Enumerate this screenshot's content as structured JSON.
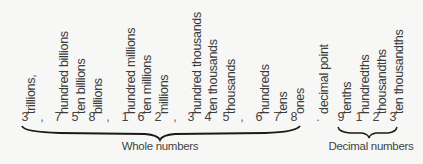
{
  "labels": [
    {
      "text": "trillions,",
      "x": 31
    },
    {
      "text": "hundred billions",
      "x": 64
    },
    {
      "text": "ten billions",
      "x": 81
    },
    {
      "text": "billions",
      "x": 98
    },
    {
      "text": "hundred millions",
      "x": 131
    },
    {
      "text": "ten millions",
      "x": 147
    },
    {
      "text": "millions",
      "x": 164
    },
    {
      "text": "hundred thousands",
      "x": 197
    },
    {
      "text": "ten thousands",
      "x": 213
    },
    {
      "text": "thousands",
      "x": 231
    },
    {
      "text": "hundreds",
      "x": 265
    },
    {
      "text": "tens",
      "x": 283
    },
    {
      "text": "ones",
      "x": 300
    },
    {
      "text": "decimal point",
      "x": 324
    },
    {
      "text": "tenths",
      "x": 347
    },
    {
      "text": "hundredths",
      "x": 365
    },
    {
      "text": "thousandths",
      "x": 382
    },
    {
      "text": "ten thousandths",
      "x": 399
    }
  ],
  "digits": [
    {
      "text": "3",
      "x": 25
    },
    {
      "text": ",",
      "x": 42,
      "sep": true
    },
    {
      "text": "7",
      "x": 58
    },
    {
      "text": "5",
      "x": 75
    },
    {
      "text": "8",
      "x": 92
    },
    {
      "text": ",",
      "x": 108,
      "sep": true
    },
    {
      "text": "1",
      "x": 125
    },
    {
      "text": "6",
      "x": 141
    },
    {
      "text": "2",
      "x": 158
    },
    {
      "text": ",",
      "x": 175,
      "sep": true
    },
    {
      "text": "3",
      "x": 191
    },
    {
      "text": "4",
      "x": 208
    },
    {
      "text": "5",
      "x": 226
    },
    {
      "text": ",",
      "x": 242,
      "sep": true
    },
    {
      "text": "6",
      "x": 259
    },
    {
      "text": "7",
      "x": 277
    },
    {
      "text": "8",
      "x": 294
    },
    {
      "text": ".",
      "x": 318,
      "sep": true
    },
    {
      "text": "9",
      "x": 341
    },
    {
      "text": "1",
      "x": 359
    },
    {
      "text": "2",
      "x": 376
    },
    {
      "text": "3",
      "x": 393
    }
  ],
  "captions": {
    "whole": "Whole numbers",
    "decimal": "Decimal numbers"
  },
  "colors": {
    "background": "#f7f7f5",
    "text": "#333333",
    "brace": "#1a1a1a"
  }
}
